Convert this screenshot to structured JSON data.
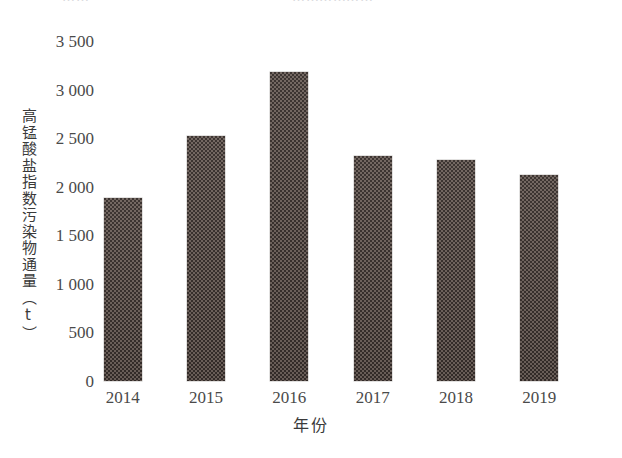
{
  "page": {
    "background": "#ffffff",
    "top_cut_fragments": {
      "left": "⋯⋯",
      "right": "⋯⋯⋯⋯⋯⋯"
    }
  },
  "chart_data": {
    "type": "bar",
    "title": "",
    "subtitle": "",
    "categories": [
      "2014",
      "2015",
      "2016",
      "2017",
      "2018",
      "2019"
    ],
    "values": [
      1880,
      2520,
      3180,
      2320,
      2280,
      2120
    ],
    "series": [
      {
        "name": "高锰酸盐指数污染物通量",
        "values": [
          1880,
          2520,
          3180,
          2320,
          2280,
          2120
        ]
      }
    ],
    "xlabel": "年份",
    "ylabel": "高锰酸盐指数污染物通量（t）",
    "ylim": [
      0,
      3500
    ],
    "yticks": [
      0,
      500,
      1000,
      1500,
      2000,
      2500,
      3000,
      3500
    ],
    "ytick_labels": [
      "0",
      "500",
      "1 000",
      "1 500",
      "2 000",
      "2 500",
      "3 000",
      "3 500"
    ],
    "xtick_labels": [
      "2014",
      "2015",
      "2016",
      "2017",
      "2018",
      "2019"
    ],
    "grid": false,
    "legend": null,
    "legend_position": "none",
    "bar_color": "#4a403c",
    "bar_pattern": "checkerboard-dither",
    "annotations": []
  }
}
